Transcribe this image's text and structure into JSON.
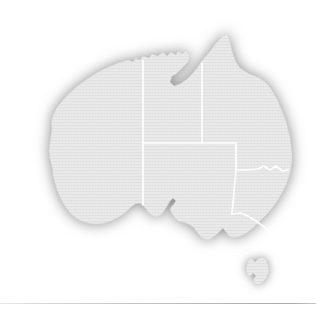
{
  "figure": {
    "title": "Map of Australia",
    "subject": "Australia",
    "style": "grayscale silhouette with soft drop shadow",
    "background_color": "#ffffff",
    "land_fill_color": "#e9e9e9",
    "land_fill_color_dark": "#dcdcdc",
    "shadow_color": "#8d8d8d",
    "border_line_color": "#ffffff",
    "outline_color": "#d2d2d2"
  },
  "map": {
    "name": "australia-map",
    "projection_hint": "plain outline, no graticule",
    "regions": [
      {
        "id": "western-australia",
        "label": "Western Australia",
        "abbr": "WA",
        "fill": "#e9e9e9"
      },
      {
        "id": "northern-territory",
        "label": "Northern Territory",
        "abbr": "NT",
        "fill": "#e9e9e9"
      },
      {
        "id": "queensland",
        "label": "Queensland",
        "abbr": "QLD",
        "fill": "#e9e9e9"
      },
      {
        "id": "south-australia",
        "label": "South Australia",
        "abbr": "SA",
        "fill": "#e9e9e9"
      },
      {
        "id": "new-south-wales",
        "label": "New South Wales",
        "abbr": "NSW",
        "fill": "#e9e9e9"
      },
      {
        "id": "victoria",
        "label": "Victoria",
        "abbr": "VIC",
        "fill": "#e9e9e9"
      },
      {
        "id": "tasmania",
        "label": "Tasmania",
        "abbr": "TAS",
        "fill": "#e9e9e9"
      }
    ],
    "features": [
      {
        "id": "cape-york-peninsula",
        "label": "Cape York Peninsula"
      },
      {
        "id": "gulf-of-carpentaria",
        "label": "Gulf of Carpentaria"
      },
      {
        "id": "great-australian-bight",
        "label": "Great Australian Bight"
      },
      {
        "id": "bass-strait",
        "label": "Bass Strait"
      },
      {
        "id": "eyre-peninsula",
        "label": "Eyre Peninsula"
      },
      {
        "id": "arnhem-land",
        "label": "Arnhem Land"
      }
    ]
  },
  "footer": {
    "rule_label": "horizontal divider rule",
    "rule_color": "#bdbdbd"
  }
}
